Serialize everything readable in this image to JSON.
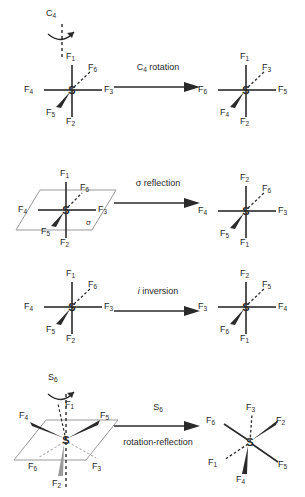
{
  "diagram": {
    "molecule_center_atom": "S",
    "colors": {
      "stroke": "#2a2a2a",
      "plane": "#9a9a9a",
      "background": "#ffffff",
      "faint_bond": "#b0b0b0"
    }
  },
  "rows": [
    {
      "id": "c4-rotation",
      "axis_label": "C",
      "axis_sub": "4",
      "operation": {
        "text_before": "C",
        "sub": "4",
        "text_after": " rotation",
        "below": ""
      },
      "left": {
        "labels": [
          {
            "name": "F",
            "sub": "1",
            "pos": "top"
          },
          {
            "name": "F",
            "sub": "6",
            "pos": "upper-right"
          },
          {
            "name": "F",
            "sub": "4",
            "pos": "left"
          },
          {
            "name": "F",
            "sub": "3",
            "pos": "right"
          },
          {
            "name": "F",
            "sub": "5",
            "pos": "lower-left"
          },
          {
            "name": "F",
            "sub": "2",
            "pos": "bottom"
          }
        ]
      },
      "right": {
        "labels": [
          {
            "name": "F",
            "sub": "1",
            "pos": "top"
          },
          {
            "name": "F",
            "sub": "3",
            "pos": "upper-right"
          },
          {
            "name": "F",
            "sub": "6",
            "pos": "left"
          },
          {
            "name": "F",
            "sub": "5",
            "pos": "right"
          },
          {
            "name": "F",
            "sub": "4",
            "pos": "lower-left"
          },
          {
            "name": "F",
            "sub": "2",
            "pos": "bottom"
          }
        ]
      }
    },
    {
      "id": "sigma-reflection",
      "plane_label": "σ",
      "operation": {
        "text_before": "σ reflection",
        "sub": "",
        "text_after": "",
        "below": ""
      },
      "left": {
        "labels": [
          {
            "name": "F",
            "sub": "1",
            "pos": "top"
          },
          {
            "name": "F",
            "sub": "6",
            "pos": "upper-right"
          },
          {
            "name": "F",
            "sub": "4",
            "pos": "left"
          },
          {
            "name": "F",
            "sub": "3",
            "pos": "right"
          },
          {
            "name": "F",
            "sub": "5",
            "pos": "lower-left"
          },
          {
            "name": "F",
            "sub": "2",
            "pos": "bottom"
          }
        ]
      },
      "right": {
        "labels": [
          {
            "name": "F",
            "sub": "2",
            "pos": "top"
          },
          {
            "name": "F",
            "sub": "6",
            "pos": "upper-right"
          },
          {
            "name": "F",
            "sub": "4",
            "pos": "left"
          },
          {
            "name": "F",
            "sub": "3",
            "pos": "right"
          },
          {
            "name": "F",
            "sub": "5",
            "pos": "lower-left"
          },
          {
            "name": "F",
            "sub": "1",
            "pos": "bottom"
          }
        ]
      }
    },
    {
      "id": "i-inversion",
      "operation": {
        "text_before": "i",
        "sub": "",
        "text_after": " inversion",
        "below": "",
        "italic_first": true
      },
      "left": {
        "labels": [
          {
            "name": "F",
            "sub": "1",
            "pos": "top"
          },
          {
            "name": "F",
            "sub": "6",
            "pos": "upper-right"
          },
          {
            "name": "F",
            "sub": "4",
            "pos": "left"
          },
          {
            "name": "F",
            "sub": "3",
            "pos": "right"
          },
          {
            "name": "F",
            "sub": "5",
            "pos": "lower-left"
          },
          {
            "name": "F",
            "sub": "2",
            "pos": "bottom"
          }
        ]
      },
      "right": {
        "labels": [
          {
            "name": "F",
            "sub": "2",
            "pos": "top"
          },
          {
            "name": "F",
            "sub": "5",
            "pos": "upper-right"
          },
          {
            "name": "F",
            "sub": "3",
            "pos": "left"
          },
          {
            "name": "F",
            "sub": "4",
            "pos": "right"
          },
          {
            "name": "F",
            "sub": "6",
            "pos": "lower-left"
          },
          {
            "name": "F",
            "sub": "1",
            "pos": "bottom"
          }
        ]
      }
    },
    {
      "id": "s6-rotation-reflection",
      "axis_label": "S",
      "axis_sub": "6",
      "operation": {
        "text_before": "S",
        "sub": "6",
        "text_after": "",
        "below": "rotation-reflection"
      },
      "left": {
        "labels": [
          {
            "name": "F",
            "sub": "1",
            "pos": "up-axis"
          },
          {
            "name": "F",
            "sub": "4",
            "pos": "upper-left-wedge"
          },
          {
            "name": "F",
            "sub": "5",
            "pos": "upper-right-wedge"
          },
          {
            "name": "F",
            "sub": "6",
            "pos": "lower-left-dash"
          },
          {
            "name": "F",
            "sub": "3",
            "pos": "lower-right-dash"
          },
          {
            "name": "F",
            "sub": "2",
            "pos": "down-axis"
          }
        ]
      },
      "right": {
        "labels": [
          {
            "name": "F",
            "sub": "3",
            "pos": "top-dash"
          },
          {
            "name": "F",
            "sub": "2",
            "pos": "upper-right-wedge"
          },
          {
            "name": "F",
            "sub": "6",
            "pos": "upper-left"
          },
          {
            "name": "F",
            "sub": "5",
            "pos": "lower-right"
          },
          {
            "name": "F",
            "sub": "1",
            "pos": "lower-left-dash"
          },
          {
            "name": "F",
            "sub": "4",
            "pos": "bottom-wedge"
          }
        ]
      }
    }
  ]
}
